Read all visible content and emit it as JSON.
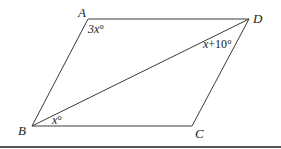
{
  "diagram": {
    "colors": {
      "line": "#3a3a3a",
      "text": "#222222",
      "rule": "#555555",
      "background": "#ffffff"
    },
    "vertices": {
      "A": {
        "label": "A",
        "x": 88,
        "y": 19
      },
      "B": {
        "label": "B",
        "x": 32,
        "y": 126
      },
      "C": {
        "label": "C",
        "x": 192,
        "y": 126
      },
      "D": {
        "label": "D",
        "x": 249,
        "y": 19
      }
    },
    "edges": [
      {
        "from": "A",
        "to": "D"
      },
      {
        "from": "D",
        "to": "C"
      },
      {
        "from": "C",
        "to": "B"
      },
      {
        "from": "B",
        "to": "A"
      },
      {
        "from": "B",
        "to": "D"
      }
    ],
    "angles": {
      "A": {
        "var": "3x",
        "suffix": "°",
        "full": "3x°"
      },
      "D": {
        "var": "x",
        "suffix": "+10°",
        "full": "x+10°"
      },
      "B": {
        "var": "x",
        "suffix": "°",
        "full": "x°"
      }
    }
  }
}
